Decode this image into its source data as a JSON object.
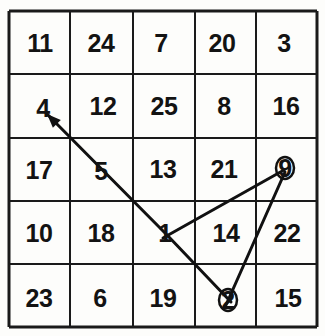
{
  "figure": {
    "kind": "number-grid-path-trace",
    "grid_rows": 5,
    "grid_cols": 5,
    "background_color": "#fdfdfb",
    "grid_line_color": "#1a1a1a",
    "path_line_color": "#111111",
    "number_color": "#131313"
  },
  "grid": {
    "left": 9,
    "top": 11,
    "right": 317,
    "bottom": 327,
    "x_lines": [
      9,
      70,
      133,
      195,
      256,
      317
    ],
    "y_lines": [
      11,
      74,
      138,
      201,
      264,
      327
    ],
    "rows": [
      [
        "11",
        "24",
        "7",
        "20",
        "3"
      ],
      [
        "4",
        "12",
        "25",
        "8",
        "16"
      ],
      [
        "17",
        "5",
        "13",
        "21",
        "9"
      ],
      [
        "10",
        "18",
        "1",
        "14",
        "22"
      ],
      [
        "23",
        "6",
        "19",
        "2",
        "15"
      ]
    ]
  },
  "cells": [
    {
      "text": "11",
      "row": 0,
      "col": 0,
      "cx": 40,
      "cy": 43
    },
    {
      "text": "24",
      "row": 0,
      "col": 1,
      "cx": 101,
      "cy": 43
    },
    {
      "text": "7",
      "row": 0,
      "col": 2,
      "cx": 161,
      "cy": 43
    },
    {
      "text": "20",
      "row": 0,
      "col": 3,
      "cx": 222,
      "cy": 43
    },
    {
      "text": "3",
      "row": 0,
      "col": 4,
      "cx": 284,
      "cy": 43
    },
    {
      "text": "4",
      "row": 1,
      "col": 0,
      "cx": 43,
      "cy": 108
    },
    {
      "text": "12",
      "row": 1,
      "col": 1,
      "cx": 103,
      "cy": 106
    },
    {
      "text": "25",
      "row": 1,
      "col": 2,
      "cx": 164,
      "cy": 106
    },
    {
      "text": "8",
      "row": 1,
      "col": 3,
      "cx": 224,
      "cy": 106
    },
    {
      "text": "16",
      "row": 1,
      "col": 4,
      "cx": 286,
      "cy": 106
    },
    {
      "text": "17",
      "row": 2,
      "col": 0,
      "cx": 39,
      "cy": 170
    },
    {
      "text": "5",
      "row": 2,
      "col": 1,
      "cx": 101,
      "cy": 171
    },
    {
      "text": "13",
      "row": 2,
      "col": 2,
      "cx": 163,
      "cy": 169
    },
    {
      "text": "21",
      "row": 2,
      "col": 3,
      "cx": 224,
      "cy": 169
    },
    {
      "text": "9",
      "row": 2,
      "col": 4,
      "cx": 285,
      "cy": 168
    },
    {
      "text": "10",
      "row": 3,
      "col": 0,
      "cx": 39,
      "cy": 233
    },
    {
      "text": "18",
      "row": 3,
      "col": 1,
      "cx": 101,
      "cy": 233
    },
    {
      "text": "1",
      "row": 3,
      "col": 2,
      "cx": 165,
      "cy": 233
    },
    {
      "text": "14",
      "row": 3,
      "col": 3,
      "cx": 226,
      "cy": 233
    },
    {
      "text": "22",
      "row": 3,
      "col": 4,
      "cx": 287,
      "cy": 233
    },
    {
      "text": "23",
      "row": 4,
      "col": 0,
      "cx": 39,
      "cy": 298
    },
    {
      "text": "6",
      "row": 4,
      "col": 1,
      "cx": 100,
      "cy": 298
    },
    {
      "text": "19",
      "row": 4,
      "col": 2,
      "cx": 163,
      "cy": 298
    },
    {
      "text": "2",
      "row": 4,
      "col": 3,
      "cx": 228,
      "cy": 300
    },
    {
      "text": "15",
      "row": 4,
      "col": 4,
      "cx": 288,
      "cy": 298
    }
  ],
  "path": {
    "sequence": [
      "2",
      "9",
      "1",
      "4"
    ],
    "arrow_at": "4",
    "segments": [
      {
        "name": "segment-4-to-1",
        "from": "4",
        "to": "1",
        "x1": 47,
        "y1": 114,
        "x2": 168,
        "y2": 236
      },
      {
        "name": "segment-1-to-2",
        "from": "1",
        "to": "2",
        "x1": 168,
        "y1": 236,
        "x2": 231,
        "y2": 302
      },
      {
        "name": "segment-1-to-9",
        "from": "1",
        "to": "9",
        "x1": 163,
        "y1": 238,
        "x2": 284,
        "y2": 170
      },
      {
        "name": "segment-9-to-2",
        "from": "9",
        "to": "2",
        "x1": 285,
        "y1": 172,
        "x2": 226,
        "y2": 305
      }
    ],
    "nodes": [
      {
        "name": "node-9",
        "label": "9",
        "cx": 285,
        "cy": 168,
        "rx": 9,
        "ry": 11
      },
      {
        "name": "node-2",
        "label": "2",
        "cx": 228,
        "cy": 300,
        "rx": 9,
        "ry": 11
      }
    ]
  }
}
